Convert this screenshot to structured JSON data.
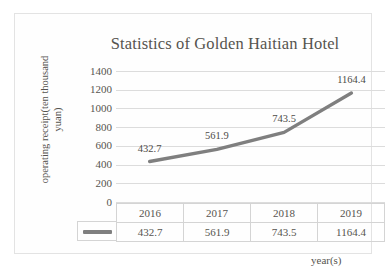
{
  "chart_data": {
    "type": "line",
    "title": "Statistics of Golden Haitian Hotel",
    "xlabel": "year(s)",
    "ylabel": "operating receipt(ten thousand yuan)",
    "ylabel_lines": [
      "operating receipt(ten thousand",
      "yuan)"
    ],
    "categories": [
      "2016",
      "2017",
      "2018",
      "2019"
    ],
    "values": [
      432.7,
      561.9,
      743.5,
      1164.4
    ],
    "point_labels": [
      "432.7",
      "561.9",
      "743.5",
      "1164.4"
    ],
    "ylim": [
      0,
      1400
    ],
    "ytick_labels": [
      "1400",
      "1200",
      "1000",
      "800",
      "600",
      "400",
      "200",
      "0"
    ],
    "ytick_values": [
      1400,
      1200,
      1000,
      800,
      600,
      400,
      200,
      0
    ],
    "grid": true,
    "legend_position": "table-row-marker",
    "series": [
      {
        "name": "operating receipt",
        "values": [
          432.7,
          561.9,
          743.5,
          1164.4
        ],
        "color": "#7f7f7f",
        "marker": "none",
        "line_width": 3.4
      }
    ],
    "data_table": {
      "header": [
        "",
        "2016",
        "2017",
        "2018",
        "2019"
      ],
      "rows": [
        [
          "legend-line-marker",
          "432.7",
          "561.9",
          "743.5",
          "1164.4"
        ]
      ]
    }
  },
  "colors": {
    "series_line": "#7f7f7f",
    "gridline": "#dcdcdc",
    "table_border": "#d4d4d4",
    "text": "#56544f",
    "frame_border": "#e3e3e3",
    "background": "#ffffff"
  },
  "table": {
    "years": [
      "2016",
      "2017",
      "2018",
      "2019"
    ],
    "receipts": [
      "432.7",
      "561.9",
      "743.5",
      "1164.4"
    ]
  }
}
